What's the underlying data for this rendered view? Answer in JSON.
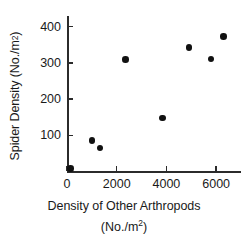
{
  "chart_data": {
    "type": "scatter",
    "title": "",
    "xlabel": "Density of Other Arthropods (No./m2)",
    "xlabel_line1": "Density of Other Arthropods",
    "xlabel_line2_prefix": "(No./m",
    "xlabel_line2_sup": "2",
    "xlabel_line2_suffix": ")",
    "ylabel": "Spider Density (No./m2)",
    "ylabel_prefix": "Spider Density (No./m",
    "ylabel_sup": "2",
    "ylabel_suffix": ")",
    "xlim": [
      0,
      7000
    ],
    "ylim": [
      0,
      430
    ],
    "xticks": [
      0,
      2000,
      4000,
      6000
    ],
    "xtick_labels": [
      "0",
      "2000",
      "4000",
      "6000"
    ],
    "yticks": [
      100,
      200,
      300,
      400
    ],
    "ytick_labels": [
      "100",
      "200",
      "300",
      "400"
    ],
    "grid": false,
    "legend": null,
    "marker": "filled-circle",
    "marker_color": "#111111",
    "axis_color": "#2b2b2b",
    "background": "#ffffff",
    "points": [
      {
        "x": 150,
        "y": 8
      },
      {
        "x": 1000,
        "y": 86
      },
      {
        "x": 1330,
        "y": 65
      },
      {
        "x": 2360,
        "y": 309
      },
      {
        "x": 3840,
        "y": 148
      },
      {
        "x": 4900,
        "y": 343
      },
      {
        "x": 5800,
        "y": 311
      },
      {
        "x": 6300,
        "y": 374
      }
    ]
  }
}
